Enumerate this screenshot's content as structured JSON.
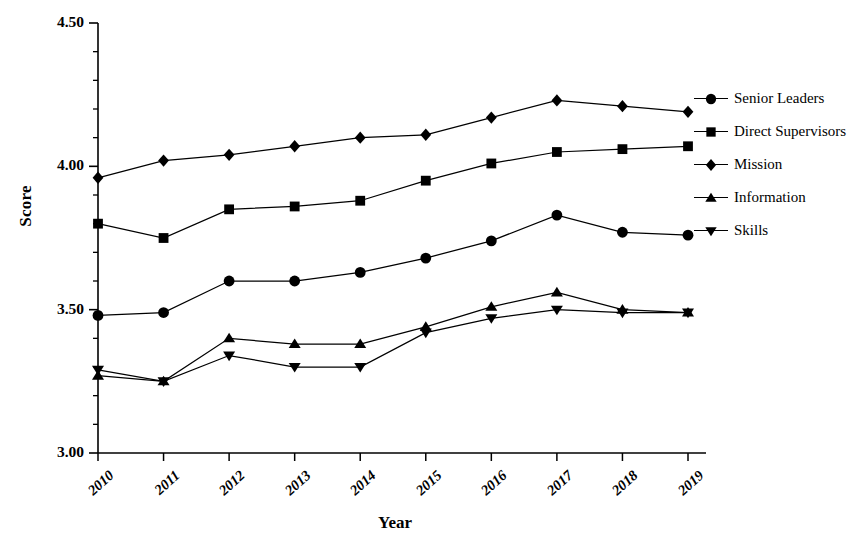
{
  "chart_data": {
    "type": "line",
    "title": "",
    "xlabel": "Year",
    "ylabel": "Score",
    "categories": [
      "2010",
      "2011",
      "2012",
      "2013",
      "2014",
      "2015",
      "2016",
      "2017",
      "2018",
      "2019"
    ],
    "ylim": [
      3.0,
      4.5
    ],
    "xlim": [
      2010,
      2019
    ],
    "grid": false,
    "legend_position": "right",
    "y_major_ticks": [
      "3.00",
      "3.50",
      "4.00",
      "4.50"
    ],
    "y_major_values": [
      3.0,
      3.5,
      4.0,
      4.5
    ],
    "y_minor_step": 0.1,
    "series": [
      {
        "name": "Senior Leaders",
        "marker": "circle",
        "values": [
          3.48,
          3.49,
          3.6,
          3.6,
          3.63,
          3.68,
          3.74,
          3.83,
          3.77,
          3.76
        ]
      },
      {
        "name": "Direct Supervisors",
        "marker": "square",
        "values": [
          3.8,
          3.75,
          3.85,
          3.86,
          3.88,
          3.95,
          4.01,
          4.05,
          4.06,
          4.07
        ]
      },
      {
        "name": "Mission",
        "marker": "diamond",
        "values": [
          3.96,
          4.02,
          4.04,
          4.07,
          4.1,
          4.11,
          4.17,
          4.23,
          4.21,
          4.19
        ]
      },
      {
        "name": "Information",
        "marker": "triangle-up",
        "values": [
          3.27,
          3.25,
          3.4,
          3.38,
          3.38,
          3.44,
          3.51,
          3.56,
          3.5,
          3.49
        ]
      },
      {
        "name": "Skills",
        "marker": "triangle-down",
        "values": [
          3.29,
          3.25,
          3.34,
          3.3,
          3.3,
          3.42,
          3.47,
          3.5,
          3.49,
          3.49
        ]
      }
    ],
    "colors": {
      "line": "#000000",
      "marker": "#000000",
      "axis": "#000000",
      "background": "#ffffff"
    }
  },
  "legend": {
    "items": [
      {
        "label": "Senior Leaders",
        "marker": "circle"
      },
      {
        "label": "Direct Supervisors",
        "marker": "square"
      },
      {
        "label": "Mission",
        "marker": "diamond"
      },
      {
        "label": "Information",
        "marker": "triangle-up"
      },
      {
        "label": "Skills",
        "marker": "triangle-down"
      }
    ]
  }
}
